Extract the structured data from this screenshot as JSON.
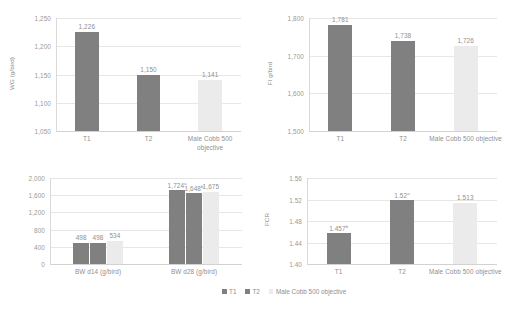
{
  "figure": {
    "series_names": [
      "T1",
      "T2",
      "Male Cobb 500 objective"
    ],
    "colors": {
      "t1": "#808080",
      "t2": "#808080",
      "objective": "#ebebeb",
      "gridline": "#e6e6e6",
      "text": "#8f8f8f"
    }
  },
  "legend": {
    "position": "bottom-center",
    "items": [
      {
        "label": "T1",
        "color": "#808080"
      },
      {
        "label": "T2",
        "color": "#808080"
      },
      {
        "label": "Male Cobb 500 objective",
        "color": "#ebebeb"
      }
    ]
  },
  "chart_data": [
    {
      "id": "wg",
      "type": "bar",
      "title": "",
      "xlabel": "",
      "ylabel": "WG (g/bird)",
      "categories": [
        "T1",
        "T2",
        "Male Cobb 500 objective"
      ],
      "values": [
        1226,
        1150,
        1141
      ],
      "labels": [
        "1,226",
        "1,150",
        "1,141"
      ],
      "superscripts": [
        "",
        "",
        ""
      ],
      "ylim": [
        1050,
        1250
      ],
      "yticks": [
        1050,
        1100,
        1150,
        1200,
        1250
      ],
      "ytick_labels": [
        "1,050",
        "1,100",
        "1,150",
        "1,200",
        "1,250"
      ],
      "grid": true,
      "legend": false
    },
    {
      "id": "fi",
      "type": "bar",
      "title": "",
      "xlabel": "",
      "ylabel": "FI g/bird",
      "categories": [
        "T1",
        "T2",
        "Male Cobb 500 objective"
      ],
      "values": [
        1781,
        1738,
        1726
      ],
      "labels": [
        "1,781",
        "1,738",
        "1,726"
      ],
      "superscripts": [
        "",
        "",
        ""
      ],
      "ylim": [
        1500,
        1800
      ],
      "yticks": [
        1500,
        1600,
        1700,
        1800
      ],
      "ytick_labels": [
        "1,500",
        "1,600",
        "1,700",
        "1,800"
      ],
      "grid": true,
      "legend": false
    },
    {
      "id": "bw",
      "type": "bar",
      "title": "",
      "xlabel": "",
      "ylabel": "",
      "categories": [
        "BW d14 (g/bird)",
        "BW d28 (g/bird)"
      ],
      "series": [
        {
          "name": "T1",
          "values": [
            498,
            1724
          ],
          "labels": [
            "498",
            "1,724"
          ],
          "superscripts": [
            "",
            "a"
          ]
        },
        {
          "name": "T2",
          "values": [
            498,
            1648
          ],
          "labels": [
            "498",
            "1,648"
          ],
          "superscripts": [
            "",
            "b"
          ]
        },
        {
          "name": "Male Cobb 500 objective",
          "values": [
            534,
            1675
          ],
          "labels": [
            "534",
            "1,675"
          ],
          "superscripts": [
            "",
            ""
          ]
        }
      ],
      "ylim": [
        0,
        2000
      ],
      "yticks": [
        0,
        400,
        800,
        1200,
        1600,
        2000
      ],
      "ytick_labels": [
        "0",
        "400",
        "800",
        "1,200",
        "1,600",
        "2,000"
      ],
      "grid": true,
      "legend": false
    },
    {
      "id": "fcr",
      "type": "bar",
      "title": "",
      "xlabel": "",
      "ylabel": "FCR",
      "categories": [
        "T1",
        "T2",
        "Male Cobb 500 objective"
      ],
      "values": [
        1.457,
        1.52,
        1.513
      ],
      "labels": [
        "1.457",
        "1.52",
        "1.513"
      ],
      "superscripts": [
        "b",
        "a",
        ""
      ],
      "ylim": [
        1.4,
        1.56
      ],
      "yticks": [
        1.4,
        1.44,
        1.48,
        1.52,
        1.56
      ],
      "ytick_labels": [
        "1.40",
        "1.44",
        "1.48",
        "1.52",
        "1.56"
      ],
      "grid": true,
      "legend": false
    }
  ]
}
